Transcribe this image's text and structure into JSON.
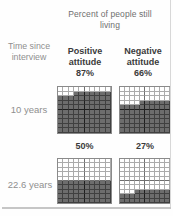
{
  "figure": {
    "title": "Percent of people still living",
    "corner_label": "Time since interview"
  },
  "chart_data": {
    "type": "waffle",
    "title": "Percent of people still living",
    "corner_label": "Time since interview",
    "grid_cols": 10,
    "grid_rows": 10,
    "unit_per_cell_percent": 1,
    "col_headers": [
      "Positive attitude",
      "Negative attitude"
    ],
    "rows": [
      {
        "label": "10 years",
        "cells": [
          {
            "column": "Positive attitude",
            "pct": 87,
            "pct_label": "87%"
          },
          {
            "column": "Negative attitude",
            "pct": 66,
            "pct_label": "66%"
          }
        ]
      },
      {
        "label": "22.6 years",
        "cells": [
          {
            "column": "Positive attitude",
            "pct": 50,
            "pct_label": "50%"
          },
          {
            "column": "Negative attitude",
            "pct": 27,
            "pct_label": "27%"
          }
        ]
      }
    ],
    "fill_rule": "bottom rows fill first; partial row fills from the right",
    "colors": {
      "filled_cell": "#6d6d6d",
      "empty_cell": "#ffffff",
      "grid_line_empty": "#ababab",
      "grid_line_filled": "#404040",
      "header_text": "#3b3b3b",
      "muted_text": "#8f8f8f"
    }
  }
}
